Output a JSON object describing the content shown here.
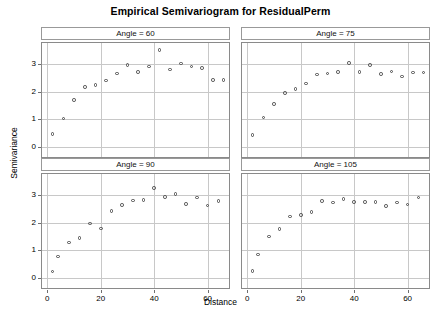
{
  "chart_data": {
    "type": "scatter",
    "title": "Empirical Semivariogram for ResidualPerm",
    "xlabel": "Distance",
    "ylabel": "Semivariance",
    "xlim": [
      -2,
      68
    ],
    "ylim": [
      -0.35,
      3.75
    ],
    "xticks": [
      0,
      20,
      40,
      60
    ],
    "yticks": [
      0,
      1,
      2,
      3
    ],
    "grid": true,
    "legend": "none",
    "layout": "2x2 lattice of conditioned panels",
    "marker": "open-circle",
    "panels": [
      {
        "label": "Angle = 60",
        "position": "top-left",
        "x": [
          2,
          6,
          10,
          14,
          18,
          22,
          26,
          30,
          34,
          38,
          42,
          46,
          50,
          54,
          58,
          62,
          66
        ],
        "y": [
          0.47,
          1.04,
          1.7,
          2.16,
          2.25,
          2.4,
          2.65,
          2.95,
          2.71,
          2.91,
          3.5,
          2.8,
          3.02,
          2.9,
          2.85,
          2.41,
          2.42
        ]
      },
      {
        "label": "Angle = 75",
        "position": "top-right",
        "x": [
          2,
          6,
          10,
          14,
          18,
          22,
          26,
          30,
          34,
          38,
          42,
          46,
          50,
          54,
          58,
          62,
          66
        ],
        "y": [
          0.44,
          1.07,
          1.55,
          1.95,
          2.1,
          2.3,
          2.61,
          2.66,
          2.7,
          3.04,
          2.7,
          2.96,
          2.63,
          2.72,
          2.55,
          2.69,
          2.69
        ]
      },
      {
        "label": "Angle = 90",
        "position": "bottom-left",
        "x": [
          2,
          4,
          8,
          12,
          16,
          20,
          24,
          28,
          32,
          36,
          40,
          44,
          48,
          52,
          56,
          60,
          64
        ],
        "y": [
          0.25,
          0.78,
          1.29,
          1.45,
          1.97,
          1.79,
          2.41,
          2.64,
          2.79,
          2.81,
          3.25,
          2.93,
          3.03,
          2.67,
          2.9,
          2.61,
          2.77
        ]
      },
      {
        "label": "Angle = 105",
        "position": "bottom-right",
        "x": [
          2,
          4,
          8,
          12,
          16,
          20,
          24,
          28,
          32,
          36,
          40,
          44,
          48,
          52,
          56,
          60,
          64
        ],
        "y": [
          0.27,
          0.85,
          1.5,
          1.77,
          2.22,
          2.27,
          2.38,
          2.78,
          2.72,
          2.86,
          2.75,
          2.75,
          2.75,
          2.59,
          2.72,
          2.65,
          2.91
        ]
      }
    ]
  },
  "colors": {
    "marker_stroke": "#4a4a4a",
    "grid": "#c8c8c8",
    "panel_border": "#8a8a8a",
    "strip_border": "#999999",
    "text": "#000000",
    "background": "#ffffff"
  }
}
